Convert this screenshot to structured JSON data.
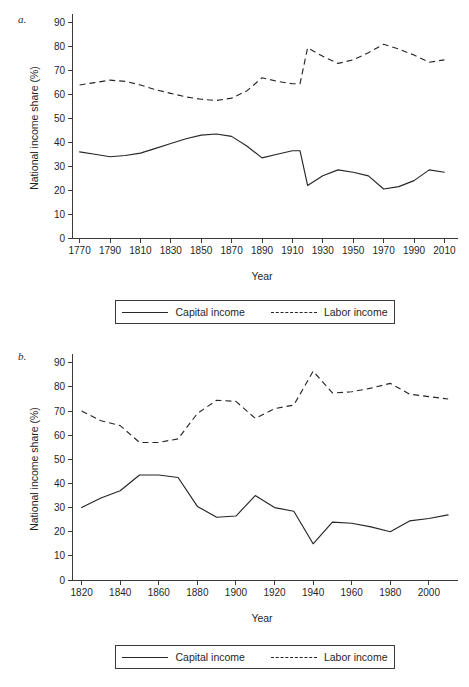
{
  "figure": {
    "panels": [
      {
        "id": "a",
        "label": "a.",
        "legend": {
          "items": [
            {
              "name": "Capital income",
              "style": "solid"
            },
            {
              "name": "Labor income",
              "style": "dashed"
            }
          ]
        },
        "chart_data": {
          "type": "line",
          "title": "",
          "xlabel": "Year",
          "ylabel": "National income share (%)",
          "xlim": [
            1765,
            2015
          ],
          "ylim": [
            0,
            92
          ],
          "xticks": [
            1770,
            1790,
            1810,
            1830,
            1850,
            1870,
            1890,
            1910,
            1930,
            1950,
            1970,
            1990,
            2010
          ],
          "yticks": [
            0,
            10,
            20,
            30,
            40,
            50,
            60,
            70,
            80,
            90
          ],
          "grid": false,
          "legend_position": "below",
          "series": [
            {
              "name": "Capital income",
              "style": "solid",
              "x": [
                1770,
                1780,
                1790,
                1800,
                1810,
                1820,
                1830,
                1840,
                1850,
                1860,
                1870,
                1880,
                1890,
                1900,
                1910,
                1915,
                1920,
                1930,
                1940,
                1950,
                1960,
                1970,
                1980,
                1990,
                2000,
                2010
              ],
              "values": [
                36,
                35,
                34,
                34.5,
                35.5,
                37.5,
                39.5,
                41.5,
                43,
                43.5,
                42.5,
                38.5,
                33.5,
                35,
                36.5,
                36.5,
                22,
                26,
                28.5,
                27.5,
                26,
                20.5,
                21.5,
                24,
                28.5,
                27.5
              ]
            },
            {
              "name": "Labor income",
              "style": "dashed",
              "x": [
                1770,
                1780,
                1790,
                1800,
                1810,
                1820,
                1830,
                1840,
                1850,
                1860,
                1870,
                1880,
                1890,
                1900,
                1910,
                1915,
                1920,
                1930,
                1940,
                1950,
                1960,
                1970,
                1980,
                1990,
                2000,
                2010
              ],
              "values": [
                64,
                65,
                66,
                65.5,
                64,
                62,
                60.5,
                59,
                58,
                57.5,
                58.5,
                61.5,
                67,
                65.5,
                64.5,
                64.5,
                79.5,
                76,
                73,
                74.5,
                77.5,
                81,
                79,
                76.5,
                73.5,
                74.5
              ]
            }
          ]
        }
      },
      {
        "id": "b",
        "label": "b.",
        "legend": {
          "items": [
            {
              "name": "Capital income",
              "style": "solid"
            },
            {
              "name": "Labor income",
              "style": "dashed"
            }
          ]
        },
        "chart_data": {
          "type": "line",
          "title": "",
          "xlabel": "Year",
          "ylabel": "National income share (%)",
          "xlim": [
            1815,
            2012
          ],
          "ylim": [
            0,
            92
          ],
          "xticks": [
            1820,
            1840,
            1860,
            1880,
            1900,
            1920,
            1940,
            1960,
            1980,
            2000
          ],
          "yticks": [
            0,
            10,
            20,
            30,
            40,
            50,
            60,
            70,
            80,
            90
          ],
          "grid": false,
          "legend_position": "below",
          "series": [
            {
              "name": "Capital income",
              "style": "solid",
              "x": [
                1820,
                1830,
                1840,
                1850,
                1860,
                1870,
                1880,
                1890,
                1900,
                1910,
                1920,
                1930,
                1940,
                1950,
                1960,
                1970,
                1980,
                1990,
                2000,
                2010
              ],
              "values": [
                30,
                34,
                37,
                43.5,
                43.5,
                42.5,
                30.5,
                26,
                26.5,
                35,
                30,
                28.5,
                15,
                24,
                23.5,
                22,
                20,
                24.5,
                25.5,
                27
              ]
            },
            {
              "name": "Labor income",
              "style": "dashed",
              "x": [
                1820,
                1830,
                1840,
                1850,
                1860,
                1870,
                1880,
                1890,
                1900,
                1910,
                1920,
                1930,
                1940,
                1950,
                1960,
                1970,
                1980,
                1990,
                2000,
                2010
              ],
              "values": [
                70,
                66,
                64,
                57,
                57,
                58.5,
                69,
                74.5,
                74,
                67,
                71,
                72.5,
                86.5,
                77.5,
                78,
                79.5,
                81.5,
                77,
                76,
                75
              ]
            }
          ]
        }
      }
    ]
  }
}
